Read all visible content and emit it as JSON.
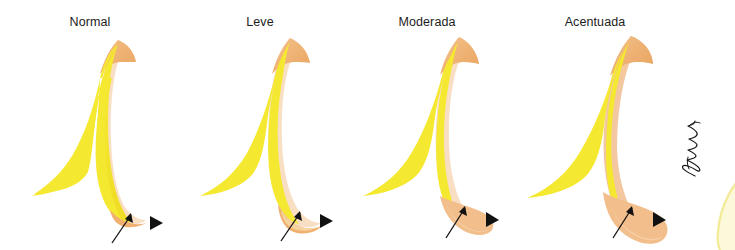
{
  "figure": {
    "background_color": "#ffffff",
    "panel_count": 4,
    "watermark_text": "PatMartins",
    "watermark_rotation_deg": -90
  },
  "palette": {
    "body_yellow": "#F5E832",
    "body_yellow_edge": "#F0DE28",
    "rim_orange": "#F0B070",
    "rim_tan": "#E7A968",
    "cream": "#F8DCC0",
    "lobe_orange": "#F4C398",
    "lobe_orange_deep": "#EFB583",
    "marker_black": "#111111",
    "label_text": "#1c1c1c",
    "edge_pale_yellow": "#F7EFA8"
  },
  "panels": [
    {
      "id": "normal",
      "label": "Normal",
      "grade": 0,
      "lobe_size": "minimal",
      "description": "Contorno normal, reborde inferior apenas visible",
      "arrowhead": {
        "x": 150,
        "y": 196
      },
      "arrow": {
        "tip_x": 131,
        "tip_y": 213,
        "tail_x": 112,
        "tail_y": 243
      }
    },
    {
      "id": "leve",
      "label": "Leve",
      "grade": 1,
      "lobe_size": "small",
      "description": "Abombamiento leve del borde inferior",
      "arrowhead": {
        "x": 320,
        "y": 194
      },
      "arrow": {
        "tip_x": 300,
        "tip_y": 211,
        "tail_x": 281,
        "tail_y": 241
      }
    },
    {
      "id": "moderada",
      "label": "Moderada",
      "grade": 2,
      "lobe_size": "medium",
      "description": "Abombamiento moderado, lobulo naranja evidente",
      "arrowhead": {
        "x": 486,
        "y": 193
      },
      "arrow": {
        "tip_x": 465,
        "tip_y": 208,
        "tail_x": 446,
        "tail_y": 238
      }
    },
    {
      "id": "acentuada",
      "label": "Acentuada",
      "grade": 3,
      "lobe_size": "large",
      "description": "Abombamiento acentuado, lobulo naranja prominente",
      "arrowhead": {
        "x": 655,
        "y": 193
      },
      "arrow": {
        "tip_x": 634,
        "tip_y": 208,
        "tail_x": 615,
        "tail_y": 238
      }
    }
  ]
}
